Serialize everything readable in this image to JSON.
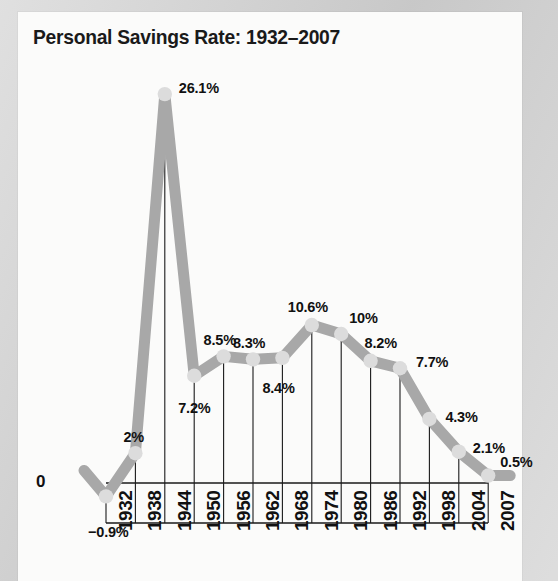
{
  "panel": {
    "background_color": "#fbfbfa",
    "outer_background_color": "#cfcfcf"
  },
  "title": "Personal Savings Rate: 1932–2007",
  "axis": {
    "zero_label": "0",
    "line_color": "#1a1a1a"
  },
  "style": {
    "line_color": "#a8a8a8",
    "marker_color": "#dcdcdc",
    "label_color": "#111111"
  },
  "chart_data": {
    "type": "line",
    "title": "Personal Savings Rate: 1932–2007",
    "xlabel": "",
    "ylabel": "",
    "categories": [
      "1932",
      "1938",
      "1944",
      "1950",
      "1956",
      "1962",
      "1968",
      "1974",
      "1980",
      "1986",
      "1992",
      "1998",
      "2004",
      "2007"
    ],
    "x": [
      1932,
      1938,
      1944,
      1950,
      1956,
      1962,
      1968,
      1974,
      1980,
      1986,
      1992,
      1998,
      2004,
      2007
    ],
    "values": [
      -0.9,
      2,
      26.1,
      7.2,
      8.5,
      8.3,
      8.4,
      10.6,
      10,
      8.2,
      7.7,
      4.3,
      2.1,
      0.5
    ],
    "point_labels": [
      "−0.9%",
      "2%",
      "26.1%",
      "7.2%",
      "8.5%",
      "8.3%",
      "8.4%",
      "10.6%",
      "10%",
      "8.2%",
      "7.7%",
      "4.3%",
      "2.1%",
      "0.5%"
    ],
    "ylim": [
      -3,
      28
    ],
    "grid": "vertical-droplines",
    "legend": "none",
    "units": "percent"
  },
  "tick_labels": {
    "t0": "1932",
    "t1": "1938",
    "t2": "1944",
    "t3": "1950",
    "t4": "1956",
    "t5": "1962",
    "t6": "1968",
    "t7": "1974",
    "t8": "1980",
    "t9": "1986",
    "t10": "1992",
    "t11": "1998",
    "t12": "2004",
    "t13": "2007"
  },
  "data_labels": {
    "d0": "−0.9%",
    "d1": "2%",
    "d2": "26.1%",
    "d3": "7.2%",
    "d4": "8.5%",
    "d5": "8.3%",
    "d6": "8.4%",
    "d7": "10.6%",
    "d8": "10%",
    "d9": "8.2%",
    "d10": "7.7%",
    "d11": "4.3%",
    "d12": "2.1%",
    "d13": "0.5%"
  }
}
